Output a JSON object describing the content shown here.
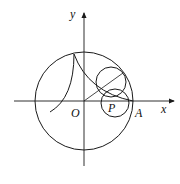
{
  "diagram": {
    "type": "geometry-figure",
    "labels": {
      "x_axis": "x",
      "y_axis": "y",
      "origin": "O",
      "point_a": "A",
      "point_p": "P"
    },
    "colors": {
      "stroke": "#1a1a1a",
      "background": "#ffffff"
    }
  }
}
